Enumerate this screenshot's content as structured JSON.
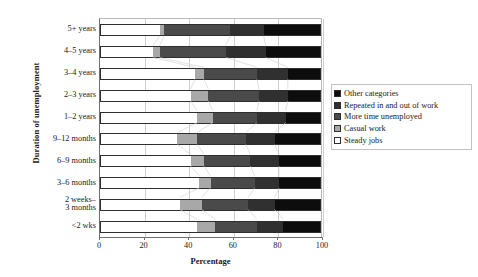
{
  "chart_data": {
    "type": "bar",
    "orientation": "horizontal",
    "stacked": true,
    "title": "",
    "xlabel": "Percentage",
    "ylabel": "Duration of unemployment",
    "xlim": [
      0,
      100
    ],
    "xticks": [
      0,
      20,
      40,
      60,
      80,
      100
    ],
    "grid": true,
    "legend_position": "right",
    "categories": [
      "5+ years",
      "4–5 years",
      "3–4 years",
      "2–3 years",
      "1–2 years",
      "9–12 months",
      "6–9 months",
      "3–6 months",
      "2 weeks–\n3 months",
      "<2 wks"
    ],
    "series": [
      {
        "name": "Steady jobs",
        "color": "#ffffff",
        "values": [
          27,
          24,
          43,
          41,
          44,
          35,
          41,
          45,
          36,
          44
        ]
      },
      {
        "name": "Casual work",
        "color": "#a8a8a8",
        "values": [
          2,
          3,
          4,
          8,
          7,
          9,
          6,
          5,
          10,
          8
        ]
      },
      {
        "name": "More time unemployed",
        "color": "#4a4a4a",
        "values": [
          30,
          30,
          24,
          23,
          20,
          22,
          21,
          20,
          21,
          19
        ]
      },
      {
        "name": "Repeated in and out of work",
        "color": "#303030",
        "values": [
          15,
          18,
          14,
          13,
          13,
          13,
          13,
          11,
          12,
          12
        ]
      },
      {
        "name": "Other categories",
        "color": "#0d0d0d",
        "values": [
          26,
          25,
          15,
          15,
          16,
          21,
          19,
          19,
          21,
          17
        ]
      }
    ]
  },
  "legend": {
    "items": [
      {
        "label": "Other categories",
        "color": "#0d0d0d"
      },
      {
        "label": "Repeated in and out of work",
        "color": "#303030"
      },
      {
        "label": "More time unemployed",
        "color": "#4a4a4a"
      },
      {
        "label": "Casual work",
        "color": "#a8a8a8"
      },
      {
        "label": "Steady jobs",
        "color": "#ffffff"
      }
    ]
  },
  "axes": {
    "x_title": "Percentage",
    "y_title": "Duration of unemployment",
    "x_tick_labels": [
      "0",
      "20",
      "40",
      "60",
      "80",
      "100"
    ]
  }
}
